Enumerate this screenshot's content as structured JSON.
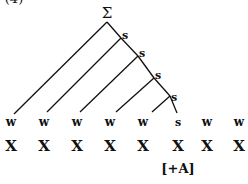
{
  "example_number": "(4)",
  "root": {
    "label": "Σ",
    "x": 107,
    "y": 13
  },
  "s_nodes": [
    {
      "label": "s",
      "x": 125,
      "y": 36
    },
    {
      "label": "s",
      "x": 141,
      "y": 54
    },
    {
      "label": "s",
      "x": 157,
      "y": 76
    },
    {
      "label": "s",
      "x": 174,
      "y": 98
    }
  ],
  "terminals": [
    {
      "label": "w",
      "x": 11
    },
    {
      "label": "w",
      "x": 44
    },
    {
      "label": "w",
      "x": 77
    },
    {
      "label": "w",
      "x": 110
    },
    {
      "label": "w",
      "x": 143
    },
    {
      "label": "s",
      "x": 178
    },
    {
      "label": "w",
      "x": 207
    },
    {
      "label": "w",
      "x": 239
    }
  ],
  "segments": [
    "X",
    "X",
    "X",
    "X",
    "X",
    "X",
    "X",
    "X"
  ],
  "feature": {
    "label": "[+A]",
    "x": 178
  }
}
